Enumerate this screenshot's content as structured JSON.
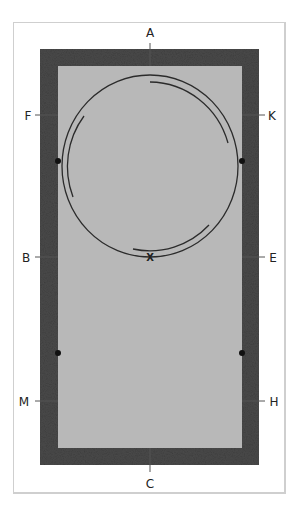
{
  "diagram": {
    "type": "dressage-arena",
    "colors": {
      "frame": "#cfcfcf",
      "surround": "#454545",
      "arena": "#b8b8b8",
      "line": "#2b2b2b",
      "text": "#222222"
    },
    "markers": [
      {
        "letter": "A",
        "position": "top-center"
      },
      {
        "letter": "F",
        "position": "left-upper"
      },
      {
        "letter": "K",
        "position": "right-upper"
      },
      {
        "letter": "B",
        "position": "left-middle"
      },
      {
        "letter": "E",
        "position": "right-middle"
      },
      {
        "letter": "M",
        "position": "left-lower"
      },
      {
        "letter": "H",
        "position": "right-lower"
      },
      {
        "letter": "C",
        "position": "bottom-center"
      }
    ],
    "center_mark": "X",
    "circle": {
      "description": "20m circle at A end",
      "touches": [
        "A-side",
        "X"
      ]
    },
    "track_arcs": 3,
    "dots": 4
  }
}
